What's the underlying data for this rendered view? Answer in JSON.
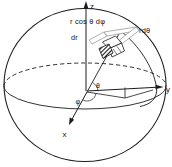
{
  "diagram": {
    "type": "spherical-coordinate-volume-element",
    "axes": {
      "z": "z",
      "y": "y",
      "x": "x"
    },
    "angles": {
      "theta": "θ",
      "phi": "φ"
    },
    "element_edges": {
      "azimuthal_arc": "r cos θ dφ",
      "radial": "dr",
      "polar_arc": "rdθ"
    },
    "colors": {
      "stroke": "#1c1c1c",
      "light_stroke": "#8c8c8c",
      "background": "#ffffff",
      "hatch_fill": "#1c1c1c"
    }
  }
}
